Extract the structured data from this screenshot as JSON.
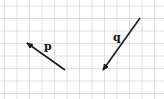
{
  "diagram": {
    "type": "vector-grid",
    "grid": {
      "origin_x": 4.5,
      "origin_y": 6,
      "cell": 12.5,
      "cols": 13,
      "rows": 7,
      "line_color": "#d8d8d8"
    },
    "vectors": [
      {
        "label": "p",
        "tail": [
          65,
          70
        ],
        "head": [
          27,
          43
        ],
        "label_pos": [
          44,
          41
        ],
        "color": "#1a1a1a"
      },
      {
        "label": "q",
        "tail": [
          140,
          18
        ],
        "head": [
          103,
          70
        ],
        "label_pos": [
          113,
          32
        ],
        "color": "#1a1a1a"
      }
    ]
  }
}
